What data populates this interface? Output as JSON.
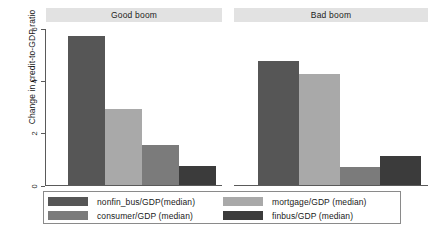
{
  "chart_data": {
    "type": "bar",
    "title": "",
    "subtitle": "",
    "xlabel": "",
    "ylabel": "Change in credit-to-GDP ratio",
    "ylim": [
      0,
      6.4
    ],
    "yticks": [
      0,
      2,
      4,
      6
    ],
    "ytick_labels": [
      "0",
      "2",
      "4",
      "6"
    ],
    "grid": false,
    "legend_position": "bottom",
    "facet_variable": "boom type",
    "categories": [
      "Good boom",
      "Bad boom"
    ],
    "series": [
      {
        "name": "nonfin_bus/GDP(median)",
        "color": "#565656",
        "values": [
          6.1,
          5.1
        ]
      },
      {
        "name": "mortgage/GDP (median)",
        "color": "#a9a9a9",
        "values": [
          3.1,
          4.55
        ]
      },
      {
        "name": "consumer/GDP (median)",
        "color": "#7b7b7b",
        "values": [
          1.65,
          0.75
        ]
      },
      {
        "name": "finbus/GDP (median)",
        "color": "#3b3b3b",
        "values": [
          0.8,
          1.2
        ]
      }
    ],
    "panels": [
      {
        "label": "Good boom",
        "bars": [
          {
            "series": "nonfin_bus/GDP(median)",
            "value": 6.1,
            "color": "#565656"
          },
          {
            "series": "mortgage/GDP (median)",
            "value": 3.1,
            "color": "#a9a9a9"
          },
          {
            "series": "consumer/GDP (median)",
            "value": 1.65,
            "color": "#7b7b7b"
          },
          {
            "series": "finbus/GDP (median)",
            "value": 0.8,
            "color": "#3b3b3b"
          }
        ]
      },
      {
        "label": "Bad boom",
        "bars": [
          {
            "series": "nonfin_bus/GDP(median)",
            "value": 5.1,
            "color": "#565656"
          },
          {
            "series": "mortgage/GDP (median)",
            "value": 4.55,
            "color": "#a9a9a9"
          },
          {
            "series": "consumer/GDP (median)",
            "value": 0.75,
            "color": "#7b7b7b"
          },
          {
            "series": "finbus/GDP (median)",
            "value": 1.2,
            "color": "#3b3b3b"
          }
        ]
      }
    ],
    "legend": [
      {
        "label": "nonfin_bus/GDP(median)",
        "color": "#565656"
      },
      {
        "label": "mortgage/GDP (median)",
        "color": "#a9a9a9"
      },
      {
        "label": "consumer/GDP (median)",
        "color": "#7b7b7b"
      },
      {
        "label": "finbus/GDP (median)",
        "color": "#3b3b3b"
      }
    ]
  },
  "axis": {
    "y_title": "Change in credit-to-GDP ratio",
    "tick_labels": [
      "6",
      "4",
      "2",
      "0"
    ]
  },
  "panel_headers": {
    "good": "Good boom",
    "bad": "Bad boom"
  },
  "colors": {
    "strip_background": "#e2e2e2",
    "axis": "#5a5a5a",
    "legend_border": "#8a8a8a",
    "background": "#ffffff"
  }
}
